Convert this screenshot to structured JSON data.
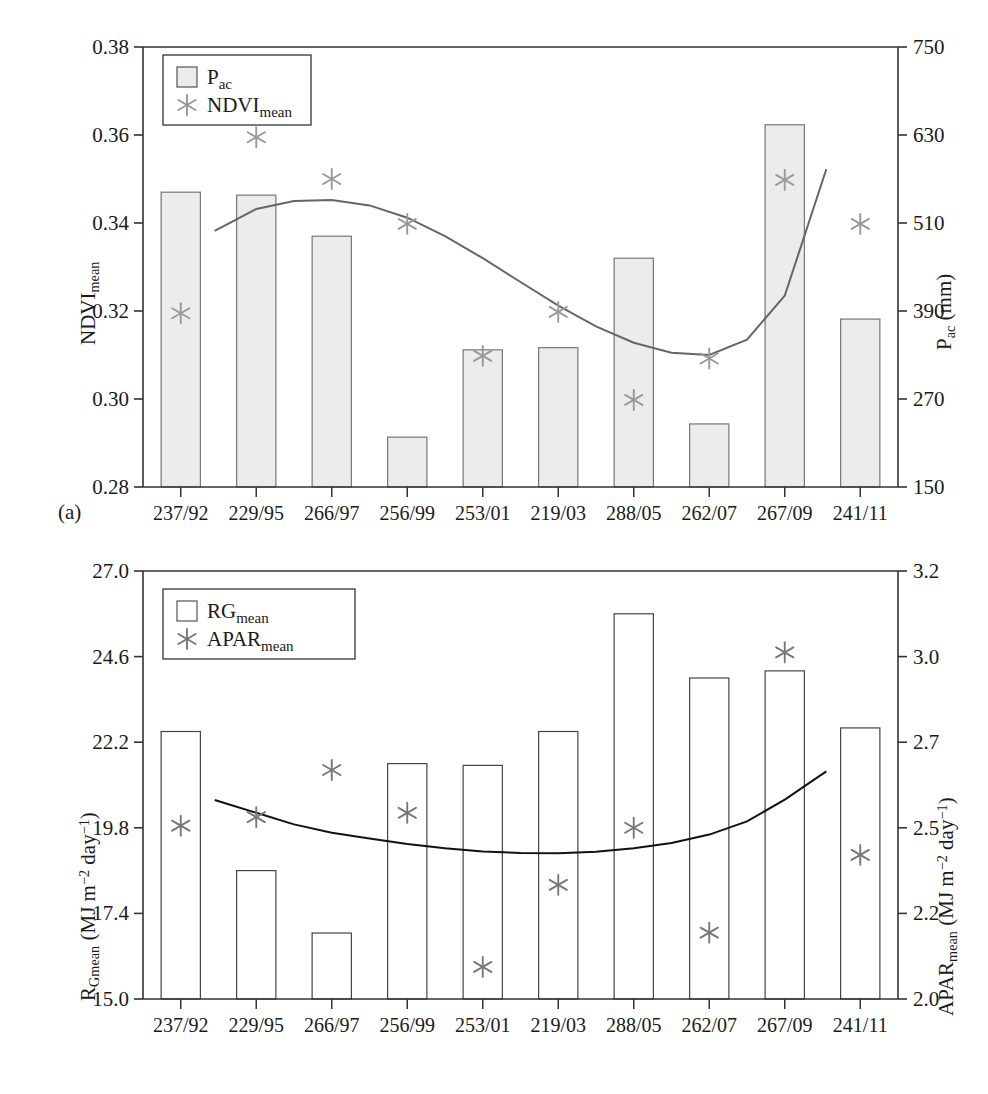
{
  "figure": {
    "panel_a_tag": "(a)",
    "panel_b_tag": "(b)"
  },
  "chart_data": [
    {
      "id": "panel-a",
      "type": "bar",
      "title": "",
      "xlabel": "",
      "ylabel": "NDVI_mean",
      "ylabel_html": "NDVI<sub>mean</sub>",
      "y2label_html": "P<sub>ac</sub> (mm)",
      "categories": [
        "237/92",
        "229/95",
        "266/97",
        "256/99",
        "253/01",
        "219/03",
        "288/05",
        "262/07",
        "267/09",
        "241/11"
      ],
      "ylim": [
        0.28,
        0.38
      ],
      "yticks": [
        "0.28",
        "0.30",
        "0.32",
        "0.34",
        "0.36",
        "0.38"
      ],
      "ytick_values": [
        0.28,
        0.3,
        0.32,
        0.34,
        0.36,
        0.38
      ],
      "y2lim": [
        150,
        750
      ],
      "y2ticks": [
        "150",
        "270",
        "390",
        "510",
        "630",
        "750"
      ],
      "y2tick_values": [
        150,
        270,
        390,
        510,
        630,
        750
      ],
      "grid": false,
      "legend_position": "top-left",
      "series": [
        {
          "name": "P_ac",
          "name_html": "P<sub>ac</sub>",
          "kind": "bar",
          "axis": "right",
          "unit": "mm",
          "color": "#ececec",
          "edge_color": "#777777",
          "values": [
            552,
            548,
            492,
            218,
            337,
            340,
            462,
            236,
            644,
            379
          ]
        },
        {
          "name": "NDVI_mean",
          "name_html": "NDVI<sub>mean</sub>",
          "kind": "scatter",
          "marker": "asterisk",
          "axis": "left",
          "color": "#999999",
          "values": [
            0.3195,
            0.3595,
            0.35,
            0.3398,
            0.3098,
            0.3198,
            0.2998,
            0.3092,
            0.3498,
            0.3398
          ]
        },
        {
          "name": "trend",
          "kind": "line",
          "axis": "left",
          "color": "#666666",
          "x": [
            0.45,
            1,
            1.5,
            2,
            2.5,
            3,
            3.5,
            4,
            4.5,
            5,
            5.5,
            6,
            6.5,
            7,
            7.5,
            8,
            8.55
          ],
          "values": [
            0.3382,
            0.3432,
            0.345,
            0.3452,
            0.344,
            0.3412,
            0.337,
            0.332,
            0.3266,
            0.3212,
            0.3165,
            0.3128,
            0.3105,
            0.31,
            0.3135,
            0.3235,
            0.3522
          ]
        }
      ]
    },
    {
      "id": "panel-b",
      "type": "bar",
      "title": "",
      "xlabel": "",
      "ylabel": "R_Gmean (MJ m-2 day-1)",
      "ylabel_html": "R<sub>Gmean</sub> (MJ m<sup>&minus;2</sup> day<sup>&minus;1</sup>)",
      "y2label_html": "APAR<sub>mean</sub> (MJ m<sup>&minus;2</sup> day<sup>&minus;1</sup>)",
      "categories": [
        "237/92",
        "229/95",
        "266/97",
        "256/99",
        "253/01",
        "219/03",
        "288/05",
        "262/07",
        "267/09",
        "241/11"
      ],
      "ylim": [
        15.0,
        27.0
      ],
      "yticks": [
        "15.0",
        "17.4",
        "19.8",
        "22.2",
        "24.6",
        "27.0"
      ],
      "ytick_values": [
        15.0,
        17.4,
        19.8,
        22.2,
        24.6,
        27.0
      ],
      "y2lim": [
        2.0,
        3.2
      ],
      "y2ticks": [
        "2.0",
        "2.2",
        "2.5",
        "2.7",
        "3.0",
        "3.2"
      ],
      "y2tick_values": [
        2.0,
        2.2,
        2.5,
        2.7,
        3.0,
        3.2
      ],
      "grid": false,
      "legend_position": "top-left",
      "series": [
        {
          "name": "RG_mean",
          "name_html": "RG<sub>mean</sub>",
          "kind": "bar",
          "axis": "left",
          "unit": "MJ m-2 day-1",
          "color": "#ffffff",
          "edge_color": "#444444",
          "values": [
            22.5,
            18.6,
            16.85,
            21.6,
            21.55,
            22.5,
            25.8,
            24.0,
            24.2,
            22.6
          ]
        },
        {
          "name": "APAR_mean",
          "name_html": "APAR<sub>mean</sub>",
          "kind": "scatter",
          "marker": "asterisk",
          "axis": "right",
          "color": "#777777",
          "values": [
            2.505,
            2.525,
            2.635,
            2.535,
            2.075,
            2.3,
            2.5,
            2.155,
            3.01,
            2.405
          ]
        },
        {
          "name": "trend",
          "kind": "line",
          "axis": "right",
          "color": "#111111",
          "x": [
            0.45,
            1,
            1.5,
            2,
            2.5,
            3,
            3.5,
            4,
            4.5,
            5,
            5.5,
            6,
            6.5,
            7,
            7.5,
            8,
            8.55
          ],
          "values": [
            2.565,
            2.535,
            2.508,
            2.483,
            2.462,
            2.443,
            2.428,
            2.417,
            2.412,
            2.411,
            2.416,
            2.428,
            2.447,
            2.476,
            2.515,
            2.566,
            2.632
          ]
        }
      ]
    }
  ]
}
